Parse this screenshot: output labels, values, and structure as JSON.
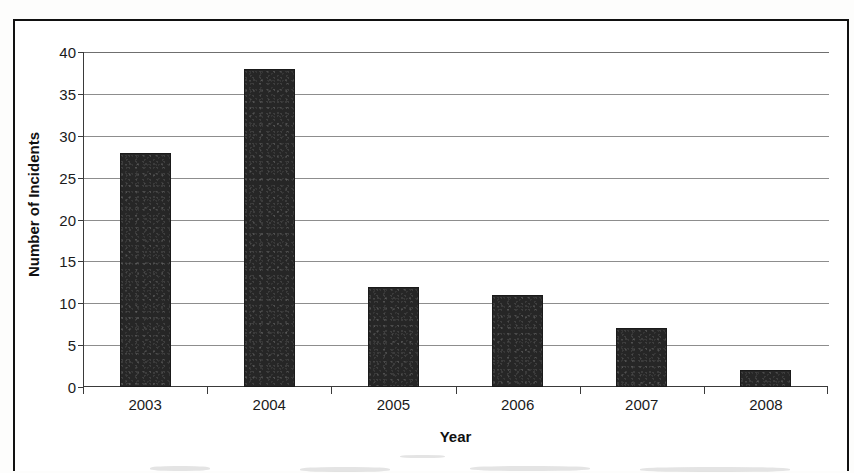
{
  "chart_data": {
    "type": "bar",
    "title": "",
    "xlabel": "Year",
    "ylabel": "Number of Incidents",
    "categories": [
      "2003",
      "2004",
      "2005",
      "2006",
      "2007",
      "2008"
    ],
    "values": [
      28,
      38,
      12,
      11,
      7,
      2
    ],
    "series": [
      {
        "name": "Number of Incidents",
        "values": [
          28,
          38,
          12,
          11,
          7,
          2
        ]
      }
    ],
    "ylim": [
      0,
      40
    ],
    "ytick_labels": [
      "0",
      "5",
      "10",
      "15",
      "20",
      "25",
      "30",
      "35",
      "40"
    ],
    "ytick_values": [
      0,
      5,
      10,
      15,
      20,
      25,
      30,
      35,
      40
    ],
    "grid": "horizontal",
    "legend": "none",
    "bar_color": "#262626",
    "gridline_color": "#8d8d8d",
    "axis_color": "#3a3a3a",
    "text_color": "#1b1b1b"
  },
  "page": {
    "border_color": "#111111",
    "background_color": "#ffffff"
  }
}
